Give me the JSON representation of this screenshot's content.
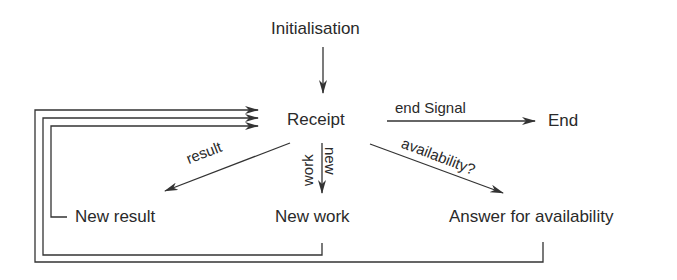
{
  "diagram": {
    "type": "state-flow",
    "nodes": {
      "initialisation": "Initialisation",
      "receipt": "Receipt",
      "end": "End",
      "new_result": "New result",
      "new_work": "New work",
      "answer_availability": "Answer for availability"
    },
    "edges": {
      "end_signal": "end Signal",
      "result": "result",
      "new_work_top": "new",
      "new_work_bottom": "work",
      "availability": "availability?"
    },
    "connections": [
      {
        "from": "Initialisation",
        "to": "Receipt",
        "label": ""
      },
      {
        "from": "Receipt",
        "to": "End",
        "label": "end Signal"
      },
      {
        "from": "Receipt",
        "to": "New result",
        "label": "result"
      },
      {
        "from": "Receipt",
        "to": "New work",
        "label": "new work"
      },
      {
        "from": "Receipt",
        "to": "Answer for availability",
        "label": "availability?"
      },
      {
        "from": "New result",
        "to": "Receipt",
        "label": ""
      },
      {
        "from": "New work",
        "to": "Receipt",
        "label": ""
      },
      {
        "from": "Answer for availability",
        "to": "Receipt",
        "label": ""
      }
    ],
    "line_color": "#333333"
  }
}
